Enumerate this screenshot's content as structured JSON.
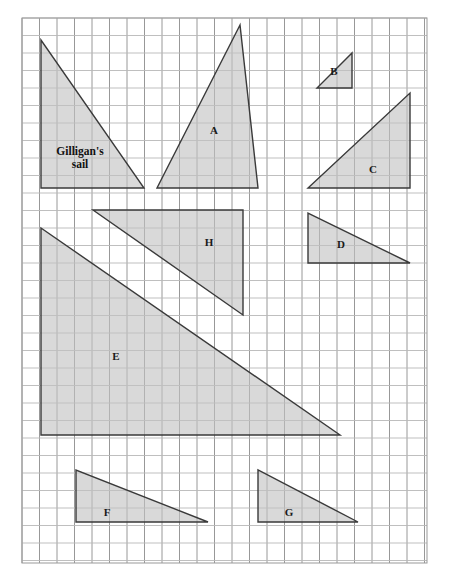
{
  "figure": {
    "background_color": "#ffffff",
    "grid": {
      "x": 22,
      "y": 18,
      "width": 405,
      "height": 545,
      "cell_size": 17.5,
      "columns": 23,
      "rows": 31,
      "line_color": "#b8b8b8",
      "major_line_color": "#8c8c8c",
      "major_every": 1,
      "border_color": "#999999"
    },
    "shape_style": {
      "fill": "#c2c2c2",
      "fill_opacity": 0.62,
      "stroke": "#3a3a3a",
      "stroke_width": 1.4
    },
    "shapes": [
      {
        "id": "gilligans-sail",
        "label": "Gilligan's\nsail",
        "label_lines": [
          "Gilligan's",
          "sail"
        ],
        "label_x": 80,
        "label_y": 155,
        "points": "41,40 41,188 144,188",
        "right_angle": "bottom-left",
        "base_cells": 6,
        "height_cells": 8.5
      },
      {
        "id": "triangle-a",
        "label": "A",
        "label_lines": [
          "A"
        ],
        "label_x": 214,
        "label_y": 131,
        "points": "240,25 157,188 258,188",
        "right_angle": "none",
        "base_cells": 5.8,
        "height_cells": 9.3
      },
      {
        "id": "triangle-b",
        "label": "B",
        "label_lines": [
          "B"
        ],
        "label_x": 334,
        "label_y": 72,
        "points": "317,88 352,88 352,53",
        "right_angle": "bottom-right",
        "base_cells": 2,
        "height_cells": 2
      },
      {
        "id": "triangle-c",
        "label": "C",
        "label_lines": [
          "C"
        ],
        "label_x": 373,
        "label_y": 170,
        "points": "308,188 410,188 410,93",
        "right_angle": "bottom-right",
        "base_cells": 5.8,
        "height_cells": 5.4
      },
      {
        "id": "triangle-d",
        "label": "D",
        "label_lines": [
          "D"
        ],
        "label_x": 341,
        "label_y": 245,
        "points": "308,213 308,263 410,263",
        "right_angle": "bottom-left",
        "base_cells": 5.8,
        "height_cells": 2.9
      },
      {
        "id": "triangle-e",
        "label": "E",
        "label_lines": [
          "E"
        ],
        "label_x": 116,
        "label_y": 357,
        "points": "41,228 41,435 340,435",
        "right_angle": "bottom-left",
        "base_cells": 17,
        "height_cells": 11.8
      },
      {
        "id": "triangle-f",
        "label": "F",
        "label_lines": [
          "F"
        ],
        "label_x": 107,
        "label_y": 513,
        "points": "76,470 76,522 208,522",
        "right_angle": "bottom-left",
        "base_cells": 7.5,
        "height_cells": 3
      },
      {
        "id": "triangle-g",
        "label": "G",
        "label_lines": [
          "G"
        ],
        "label_x": 289,
        "label_y": 513,
        "points": "258,470 258,522 358,522",
        "right_angle": "bottom-left",
        "base_cells": 5.7,
        "height_cells": 3
      },
      {
        "id": "triangle-h",
        "label": "H",
        "label_lines": [
          "H"
        ],
        "label_x": 209,
        "label_y": 243,
        "points": "93,210 243,210 243,315",
        "right_angle": "top-right",
        "base_cells": 8.6,
        "height_cells": 6
      }
    ]
  }
}
